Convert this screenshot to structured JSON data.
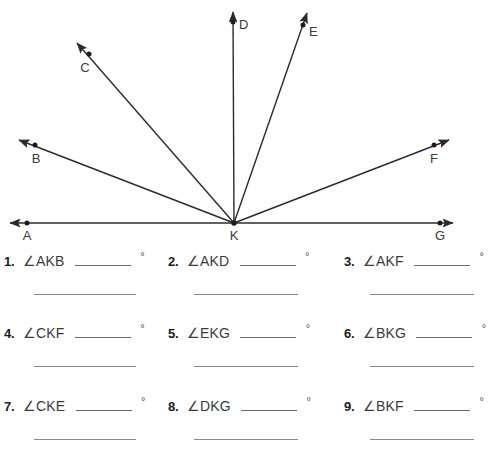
{
  "diagram": {
    "type": "angle-rays-from-vertex",
    "vertex": {
      "label": "K",
      "x": 234,
      "y": 223
    },
    "points": [
      {
        "label": "A",
        "dot_x": 27,
        "dot_y": 223,
        "label_x": 27,
        "label_y": 238,
        "ray": "line-left"
      },
      {
        "label": "B",
        "dot_x": 35,
        "dot_y": 145,
        "label_x": 36,
        "label_y": 161,
        "ray": "up-left-shallow"
      },
      {
        "label": "C",
        "dot_x": 89,
        "dot_y": 54,
        "label_x": 85,
        "label_y": 70,
        "ray": "up-left-steep"
      },
      {
        "label": "D",
        "dot_x": 233,
        "dot_y": 22,
        "label_x": 243,
        "label_y": 27,
        "ray": "vertical-up"
      },
      {
        "label": "E",
        "dot_x": 303,
        "dot_y": 25,
        "label_x": 313,
        "label_y": 34,
        "ray": "up-right-steep"
      },
      {
        "label": "F",
        "dot_x": 434,
        "dot_y": 145,
        "label_x": 433,
        "label_y": 161,
        "ray": "up-right-shallow"
      },
      {
        "label": "G",
        "dot_x": 440,
        "dot_y": 223,
        "label_x": 440,
        "label_y": 238,
        "ray": "line-right"
      }
    ],
    "baseline": {
      "y": 223,
      "x_start": 5,
      "x_end": 458,
      "double_arrow": true
    },
    "colors": {
      "stroke": "#2b2b2b",
      "label": "#3b3b3b",
      "background": "#ffffff"
    }
  },
  "questions": [
    {
      "number": "1.",
      "angle": "∠AKB",
      "answer": "",
      "unit": "°",
      "work_line": ""
    },
    {
      "number": "2.",
      "angle": "∠AKD",
      "answer": "",
      "unit": "°",
      "work_line": ""
    },
    {
      "number": "3.",
      "angle": "∠AKF",
      "answer": "",
      "unit": "°",
      "work_line": ""
    },
    {
      "number": "4.",
      "angle": "∠CKF",
      "answer": "",
      "unit": "°",
      "work_line": ""
    },
    {
      "number": "5.",
      "angle": "∠EKG",
      "answer": "",
      "unit": "°",
      "work_line": ""
    },
    {
      "number": "6.",
      "angle": "∠BKG",
      "answer": "",
      "unit": "°",
      "work_line": ""
    },
    {
      "number": "7.",
      "angle": "∠CKE",
      "answer": "",
      "unit": "°",
      "work_line": ""
    },
    {
      "number": "8.",
      "angle": "∠DKG",
      "answer": "",
      "unit": "°",
      "work_line": ""
    },
    {
      "number": "9.",
      "angle": "∠BKF",
      "answer": "",
      "unit": "°",
      "work_line": ""
    }
  ]
}
